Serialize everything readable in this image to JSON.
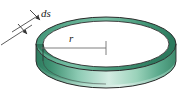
{
  "figure": {
    "type": "technical-illustration",
    "background_color": "#ffffff",
    "labels": [
      {
        "id": "ds",
        "text": "ds",
        "meaning": "differential-ring-thickness",
        "style": "italic-serif",
        "color": "#1a1a1a",
        "x": 41,
        "y": 17
      },
      {
        "id": "r",
        "text": "r",
        "meaning": "ring-radius",
        "style": "italic-serif",
        "color": "#1a1a1a",
        "x": 69,
        "y": 42
      }
    ],
    "ring": {
      "name": "green-ring-band",
      "outer_rx": 70,
      "outer_ry": 27,
      "inner_rx": 63,
      "inner_ry": 23,
      "center_x": 106,
      "center_y": 44,
      "band_height": 17,
      "outline_color": "#2a2a2a",
      "colors": {
        "top_rim_dark": "#2f8a68",
        "top_rim_mid": "#52a585",
        "top_rim_light": "#a8d7c5",
        "wall_left_dark": "#2f7d60",
        "wall_mid": "#74bfa4",
        "wall_light": "#cfe9de",
        "wall_right": "#5aa88c",
        "interior": "#ffffff"
      }
    },
    "radius_line": {
      "name": "radius-dimension-line",
      "from_x": 41,
      "from_y": 48,
      "to_x": 106,
      "to_y": 48,
      "tick_x": 106,
      "tick_top_y": 41,
      "tick_bottom_y": 55,
      "color": "#6b6b6b"
    },
    "ds_leaders": {
      "name": "ds-dimension-leaders",
      "color": "#4a4a4a",
      "upper_line": {
        "x1": 10,
        "y1": 33,
        "x2": 40,
        "y2": 14
      },
      "lower_line": {
        "x1": 0,
        "y1": 45,
        "x2": 33,
        "y2": 24
      },
      "upper_arrow_tip": {
        "x": 40,
        "y": 14
      },
      "lower_arrow_tip": {
        "x": 33,
        "y": 24
      },
      "arrow_direction": "down-left-to-ring-edge"
    }
  }
}
